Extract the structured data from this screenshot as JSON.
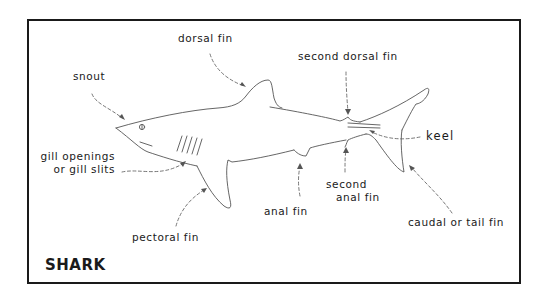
{
  "title": "SHARK",
  "labels": {
    "dorsal_fin": "dorsal fin",
    "snout": "snout",
    "second_dorsal_fin": "second dorsal fin",
    "keel": "keel",
    "gill_line1": "gill openings",
    "gill_line2": "or gill slits",
    "anal_fin": "anal fin",
    "second_anal_line1": "second",
    "second_anal_line2": "anal fin",
    "pectoral_fin": "pectoral fin",
    "caudal_fin": "caudal or tail fin"
  },
  "colors": {
    "ink": "#1a1a1a",
    "line": "#444444",
    "background": "#ffffff"
  }
}
